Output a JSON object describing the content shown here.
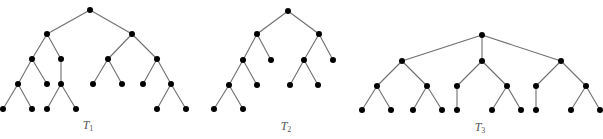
{
  "figure": {
    "colors": {
      "node": "#000000",
      "edge": "#6e6e6e",
      "label": "#555555",
      "background": "#ffffff"
    },
    "node_radius": 3,
    "trees": [
      {
        "id": "T1",
        "label_main": "T",
        "label_sub": "1",
        "label_pos": [
          88,
          118
        ],
        "nodes": {
          "r": [
            90,
            10
          ],
          "a": [
            47,
            34
          ],
          "b": [
            132,
            34
          ],
          "c": [
            32,
            59
          ],
          "d": [
            61,
            59
          ],
          "e": [
            108,
            59
          ],
          "f": [
            157,
            59
          ],
          "g": [
            18,
            84
          ],
          "h": [
            47,
            84
          ],
          "i": [
            61,
            84
          ],
          "j": [
            93,
            84
          ],
          "k": [
            122,
            84
          ],
          "l": [
            143,
            84
          ],
          "m": [
            171,
            84
          ],
          "n": [
            3,
            109
          ],
          "o": [
            32,
            109
          ],
          "p": [
            47,
            109
          ],
          "q": [
            76,
            109
          ],
          "s": [
            157,
            109
          ],
          "t": [
            186,
            109
          ]
        },
        "edges": [
          [
            "r",
            "a"
          ],
          [
            "r",
            "b"
          ],
          [
            "a",
            "c"
          ],
          [
            "a",
            "d"
          ],
          [
            "b",
            "e"
          ],
          [
            "b",
            "f"
          ],
          [
            "c",
            "g"
          ],
          [
            "c",
            "h"
          ],
          [
            "d",
            "i"
          ],
          [
            "e",
            "j"
          ],
          [
            "e",
            "k"
          ],
          [
            "f",
            "l"
          ],
          [
            "f",
            "m"
          ],
          [
            "g",
            "n"
          ],
          [
            "g",
            "o"
          ],
          [
            "i",
            "p"
          ],
          [
            "i",
            "q"
          ],
          [
            "m",
            "s"
          ],
          [
            "m",
            "t"
          ]
        ]
      },
      {
        "id": "T2",
        "label_main": "T",
        "label_sub": "2",
        "label_pos": [
          286,
          119
        ],
        "nodes": {
          "r": [
            288,
            11
          ],
          "a": [
            257,
            34
          ],
          "b": [
            319,
            34
          ],
          "c": [
            243,
            60
          ],
          "d": [
            271,
            60
          ],
          "e": [
            304,
            60
          ],
          "f": [
            333,
            60
          ],
          "g": [
            229,
            85
          ],
          "h": [
            257,
            85
          ],
          "i": [
            290,
            85
          ],
          "j": [
            318,
            85
          ],
          "k": [
            214,
            109
          ],
          "l": [
            243,
            109
          ]
        },
        "edges": [
          [
            "r",
            "a"
          ],
          [
            "r",
            "b"
          ],
          [
            "a",
            "c"
          ],
          [
            "a",
            "d"
          ],
          [
            "b",
            "e"
          ],
          [
            "b",
            "f"
          ],
          [
            "c",
            "g"
          ],
          [
            "c",
            "h"
          ],
          [
            "e",
            "i"
          ],
          [
            "e",
            "j"
          ],
          [
            "g",
            "k"
          ],
          [
            "g",
            "l"
          ]
        ]
      },
      {
        "id": "T3",
        "label_main": "T",
        "label_sub": "3",
        "label_pos": [
          480,
          120
        ],
        "nodes": {
          "r": [
            482,
            35
          ],
          "a": [
            402,
            61
          ],
          "b": [
            482,
            61
          ],
          "c": [
            561,
            61
          ],
          "d": [
            377,
            86
          ],
          "e": [
            427,
            86
          ],
          "f": [
            457,
            86
          ],
          "g": [
            507,
            86
          ],
          "h": [
            536,
            86
          ],
          "i": [
            586,
            86
          ],
          "j": [
            362,
            110
          ],
          "k": [
            391,
            110
          ],
          "l": [
            413,
            110
          ],
          "m": [
            442,
            110
          ],
          "n": [
            457,
            110
          ],
          "o": [
            492,
            110
          ],
          "p": [
            521,
            110
          ],
          "q": [
            536,
            110
          ],
          "s": [
            571,
            110
          ],
          "t": [
            600,
            110
          ]
        },
        "edges": [
          [
            "r",
            "a"
          ],
          [
            "r",
            "b"
          ],
          [
            "r",
            "c"
          ],
          [
            "a",
            "d"
          ],
          [
            "a",
            "e"
          ],
          [
            "b",
            "f"
          ],
          [
            "b",
            "g"
          ],
          [
            "c",
            "h"
          ],
          [
            "c",
            "i"
          ],
          [
            "d",
            "j"
          ],
          [
            "d",
            "k"
          ],
          [
            "e",
            "l"
          ],
          [
            "e",
            "m"
          ],
          [
            "f",
            "n"
          ],
          [
            "g",
            "o"
          ],
          [
            "g",
            "p"
          ],
          [
            "h",
            "q"
          ],
          [
            "i",
            "s"
          ],
          [
            "i",
            "t"
          ]
        ]
      }
    ]
  }
}
